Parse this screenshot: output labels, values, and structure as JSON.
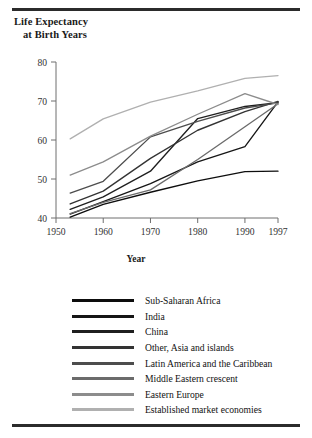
{
  "figure": {
    "title_line1": "Life Expectancy",
    "title_line2": "at Birth Years",
    "x_axis_label": "Year"
  },
  "chart_data": {
    "type": "line",
    "title": "Life Expectancy at Birth Years",
    "xlabel": "Year",
    "ylabel": "Life Expectancy at Birth Years",
    "xlim": [
      1950,
      1997
    ],
    "ylim": [
      40,
      80
    ],
    "xticks": [
      1950,
      1960,
      1970,
      1980,
      1990,
      1997
    ],
    "yticks": [
      40,
      50,
      60,
      70,
      80
    ],
    "grid": false,
    "legend_position": "below",
    "x": [
      1953,
      1960,
      1970,
      1980,
      1990,
      1997
    ],
    "series": [
      {
        "name": "Sub-Saharan Africa",
        "color": "#0d0d0d",
        "values": [
          40.2,
          43.5,
          46.6,
          49.5,
          51.9,
          52.0
        ]
      },
      {
        "name": "India",
        "color": "#161616",
        "values": [
          41.0,
          44.2,
          48.8,
          54.4,
          58.3,
          69.8
        ]
      },
      {
        "name": "China",
        "color": "#1f1f1f",
        "values": [
          42.2,
          45.4,
          52.0,
          65.5,
          68.6,
          69.6
        ]
      },
      {
        "name": "Other, Asia and islands",
        "color": "#333333",
        "values": [
          43.6,
          46.9,
          55.3,
          62.5,
          67.3,
          69.9
        ]
      },
      {
        "name": "Latin America and the Caribbean",
        "color": "#4d4d4d",
        "values": [
          46.4,
          49.4,
          60.8,
          64.8,
          68.2,
          69.5
        ]
      },
      {
        "name": "Middle Eastern crescent",
        "color": "#6b6b6b",
        "values": [
          41.1,
          44.0,
          47.2,
          55.0,
          63.4,
          69.3
        ]
      },
      {
        "name": "Eastern Europe",
        "color": "#8c8c8c",
        "values": [
          51.0,
          54.4,
          61.0,
          66.6,
          71.9,
          69.1
        ]
      },
      {
        "name": "Established market economies",
        "color": "#b0b0b0",
        "values": [
          60.3,
          65.4,
          69.7,
          72.6,
          75.8,
          76.5
        ]
      }
    ]
  },
  "legend": {
    "items": [
      {
        "label": "Sub-Saharan Africa",
        "color": "#0d0d0d"
      },
      {
        "label": "India",
        "color": "#161616"
      },
      {
        "label": "China",
        "color": "#1f1f1f"
      },
      {
        "label": "Other, Asia and islands",
        "color": "#333333"
      },
      {
        "label": "Latin America and the Caribbean",
        "color": "#4d4d4d"
      },
      {
        "label": "Middle Eastern crescent",
        "color": "#6b6b6b"
      },
      {
        "label": "Eastern Europe",
        "color": "#8c8c8c"
      },
      {
        "label": "Established market economies",
        "color": "#b0b0b0"
      }
    ]
  }
}
